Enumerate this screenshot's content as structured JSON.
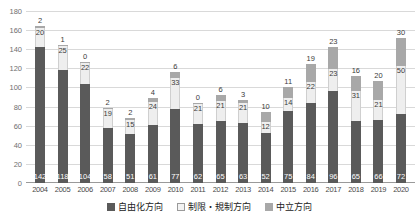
{
  "chart_data": {
    "type": "bar",
    "stacked": true,
    "title": "",
    "xlabel": "",
    "ylabel": "",
    "ylim": [
      0,
      180
    ],
    "ytick_step": 20,
    "yticks": [
      0,
      20,
      40,
      60,
      80,
      100,
      120,
      140,
      160,
      180
    ],
    "grid": true,
    "legend_position": "bottom",
    "categories": [
      "2004",
      "2005",
      "2006",
      "2007",
      "2008",
      "2009",
      "2010",
      "2011",
      "2012",
      "2013",
      "2014",
      "2015",
      "2016",
      "2017",
      "2018",
      "2019",
      "2020"
    ],
    "series": [
      {
        "name": "自由化方向",
        "color": "#5a5a5a",
        "values": [
          142,
          118,
          104,
          58,
          51,
          61,
          77,
          62,
          65,
          63,
          52,
          75,
          84,
          96,
          65,
          66,
          72
        ]
      },
      {
        "name": "制限・規制方向",
        "color": "#eeeeee",
        "values": [
          20,
          25,
          22,
          19,
          15,
          24,
          33,
          21,
          21,
          21,
          12,
          14,
          22,
          23,
          31,
          21,
          50
        ]
      },
      {
        "name": "中立方向",
        "color": "#a8a8a8",
        "values": [
          2,
          1,
          0,
          2,
          2,
          4,
          6,
          0,
          6,
          3,
          10,
          11,
          19,
          23,
          16,
          20,
          30
        ]
      }
    ],
    "totals": [
      164,
      144,
      126,
      79,
      68,
      89,
      116,
      83,
      92,
      87,
      74,
      100,
      125,
      142,
      112,
      107,
      152
    ]
  },
  "legend": {
    "items": [
      {
        "label": "自由化方向"
      },
      {
        "label": "制限・規制方向"
      },
      {
        "label": "中立方向"
      }
    ]
  }
}
